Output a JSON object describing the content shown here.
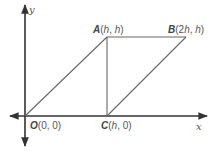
{
  "diagram": {
    "type": "coordinate-geometry",
    "axes": {
      "x_label": "x",
      "y_label": "y"
    },
    "points": [
      {
        "name": "O",
        "coords": "(0, 0)",
        "x": "0",
        "y": "0"
      },
      {
        "name": "A",
        "coords": "(h, h)",
        "x": "h",
        "y": "h"
      },
      {
        "name": "B",
        "coords": "(2h, h)",
        "x": "2h",
        "y": "h"
      },
      {
        "name": "C",
        "coords": "(h, 0)",
        "x": "h",
        "y": "0"
      }
    ],
    "segments": [
      "OA",
      "AB",
      "BC",
      "AC",
      "OC"
    ],
    "labels": {
      "O": {
        "letter": "O",
        "open": "(",
        "x": "0",
        "sep": ", ",
        "y": "0",
        "close": ")"
      },
      "A": {
        "letter": "A",
        "open": "(",
        "x": "h",
        "sep": ", ",
        "y": "h",
        "close": ")"
      },
      "B": {
        "letter": "B",
        "open": "(2",
        "x": "h",
        "sep": ", ",
        "y": "h",
        "close": ")"
      },
      "C": {
        "letter": "C",
        "open": "(",
        "x": "h",
        "sep": ", ",
        "y": "0",
        "close": ")"
      }
    },
    "colors": {
      "axis": "#333333",
      "shape": "#555555",
      "label": "#555555"
    }
  }
}
